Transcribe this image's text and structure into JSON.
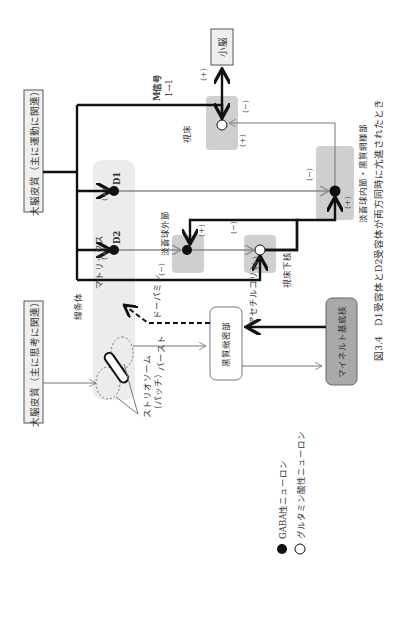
{
  "figure": {
    "caption": "図3.4　D1受容体とD2受容体が両方同時に亢進されたとき",
    "caption_number": "図3.4",
    "caption_text": "D1受容体とD2受容体が両方同時に亢進されたとき"
  },
  "boxes": {
    "cortex_thought": "大脳皮質（主に思考に関連）",
    "cortex_motor": "大脳皮質（主に運動に関連）",
    "cerebellum": "小脳",
    "snc": "黒質緻密部",
    "meynert": "マイネルト基底核"
  },
  "regions": {
    "striatum": "線条体",
    "matrix": "マトリックス",
    "striosome": "ストリオソーム",
    "patch": "（パッチ）",
    "gpe": "淡蒼球外節",
    "stn": "視床下核",
    "gpi_snr": "淡蒼球内節・黒質網様部",
    "thalamus": "視床"
  },
  "receptors": {
    "d1": "D1",
    "d2": "D2"
  },
  "signals": {
    "m_signal": "M信号",
    "m_value": "1→1",
    "dopamine": "ドーパミン",
    "acetylcholine": "アセチルコリン",
    "burst": "バースト"
  },
  "signs": {
    "plus": "(+)",
    "minus": "(−)"
  },
  "legend": {
    "gaba": "GABA性ニューロン",
    "glutamate": "グルタミン酸性ニューロン"
  },
  "colors": {
    "band": "#ececec",
    "nucleus_box": "#cfcfcf",
    "meynert_fill": "#a9a9a9",
    "box_fill": "#efefef",
    "line_dark": "#111111",
    "line_gray": "#8a8a8a"
  }
}
